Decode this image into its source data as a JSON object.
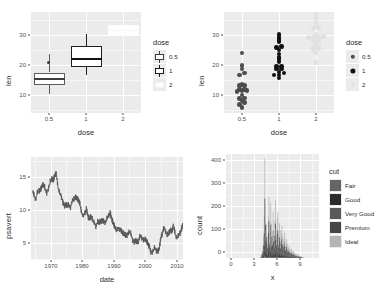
{
  "figure": {
    "layout": "2x2 grid of ggplot2 plots",
    "background": "#ffffff",
    "panel_bg": "#ebebeb",
    "gridline_color": "#ffffff",
    "text_color": "#2b2b2b"
  },
  "chart_data": [
    {
      "id": "boxplot-tooth-growth",
      "type": "boxplot",
      "title": "",
      "xlabel": "dose",
      "ylabel": "len",
      "categories": [
        "0.5",
        "1",
        "2"
      ],
      "xtick_labels": [
        "0.5",
        "1",
        "2"
      ],
      "ytick_labels": [
        "10",
        "20",
        "30"
      ],
      "yticks": [
        10,
        20,
        30
      ],
      "ylim": [
        2.5,
        34.5
      ],
      "grid": true,
      "legend": {
        "title": "dose",
        "position": "right",
        "entries": [
          {
            "label": "0.5",
            "fill": "#ffffff",
            "stroke": "#3d3d3d"
          },
          {
            "label": "1",
            "fill": "#ffffff",
            "stroke": "#1a1a1a"
          },
          {
            "label": "2",
            "fill": "#ffffff",
            "stroke": "#f2f2f2"
          }
        ]
      },
      "boxes": [
        {
          "category": "0.5",
          "lower_whisker": 4.2,
          "q1": 7.3,
          "median": 9.85,
          "q3": 11.3,
          "upper_whisker": 17.3,
          "outliers": [
            21.5
          ],
          "fill": "#ffffff",
          "stroke": "#5c5c5c"
        },
        {
          "category": "1",
          "lower_whisker": 13.6,
          "q1": 16.25,
          "median": 19.25,
          "q3": 23.4,
          "upper_whisker": 27.3,
          "outliers": [],
          "fill": "#ffffff",
          "stroke": "#1a1a1a"
        },
        {
          "category": "2",
          "lower_whisker": 22.4,
          "q1": 23.5,
          "median": 25.95,
          "q3": 27.3,
          "upper_whisker": 33.9,
          "outliers": [],
          "fill": "#ffffff",
          "stroke": "#fbfbfb"
        }
      ]
    },
    {
      "id": "dotplot-tooth-growth",
      "type": "dotplot",
      "title": "",
      "xlabel": "dose",
      "ylabel": "len",
      "categories": [
        "0.5",
        "1",
        "2"
      ],
      "xtick_labels": [
        "0.5",
        "1",
        "2"
      ],
      "ytick_labels": [
        "10",
        "20",
        "30"
      ],
      "yticks": [
        10,
        20,
        30
      ],
      "ylim": [
        2.5,
        34.5
      ],
      "grid": true,
      "legend": {
        "title": "dose",
        "position": "right",
        "entries": [
          {
            "label": "0.5",
            "color": "#4d4d4d"
          },
          {
            "label": "1",
            "color": "#111111"
          },
          {
            "label": "2",
            "color": "#e0e0e0"
          }
        ]
      },
      "series": [
        {
          "name": "0.5",
          "color": "#4d4d4d",
          "values": [
            4.2,
            11.5,
            7.3,
            5.8,
            6.4,
            10.0,
            11.2,
            11.2,
            5.2,
            7.0,
            15.2,
            21.5,
            17.6,
            9.7,
            14.5,
            10.0,
            8.2,
            9.4,
            16.5,
            9.7
          ]
        },
        {
          "name": "1",
          "color": "#111111",
          "values": [
            16.5,
            16.5,
            15.2,
            17.3,
            22.5,
            17.3,
            13.6,
            14.5,
            18.8,
            15.5,
            19.7,
            23.3,
            23.6,
            26.4,
            20.0,
            25.2,
            25.8,
            21.2,
            14.5,
            27.3
          ]
        },
        {
          "name": "2",
          "color": "#e0e0e0",
          "values": [
            23.6,
            18.5,
            33.9,
            25.5,
            26.4,
            32.5,
            26.7,
            21.5,
            23.3,
            29.5,
            25.5,
            26.4,
            22.4,
            24.5,
            24.8,
            30.9,
            26.4,
            27.3,
            29.4,
            23.0
          ]
        }
      ]
    },
    {
      "id": "line-economics-psavert",
      "type": "line",
      "title": "",
      "xlabel": "date",
      "ylabel": "psavert",
      "xtick_labels": [
        "1970",
        "1980",
        "1990",
        "2000",
        "2010"
      ],
      "xticks": [
        1970,
        1980,
        1990,
        2000,
        2010
      ],
      "ytick_labels": [
        "5",
        "10",
        "15"
      ],
      "yticks": [
        5,
        10,
        15
      ],
      "xlim": [
        1967,
        2015
      ],
      "ylim": [
        1.9,
        17.6
      ],
      "line_color": "#595959",
      "grid": true,
      "x": [
        1967.5,
        1968.0,
        1968.5,
        1969.0,
        1969.5,
        1970.0,
        1970.5,
        1971.0,
        1971.5,
        1972.0,
        1972.5,
        1973.0,
        1973.5,
        1974.0,
        1974.5,
        1975.0,
        1975.5,
        1976.0,
        1976.5,
        1977.0,
        1977.5,
        1978.0,
        1978.5,
        1979.0,
        1979.5,
        1980.0,
        1980.5,
        1981.0,
        1981.5,
        1982.0,
        1982.5,
        1983.0,
        1983.5,
        1984.0,
        1984.5,
        1985.0,
        1985.5,
        1986.0,
        1986.5,
        1987.0,
        1987.5,
        1988.0,
        1988.5,
        1989.0,
        1989.5,
        1990.0,
        1990.5,
        1991.0,
        1991.5,
        1992.0,
        1992.5,
        1993.0,
        1993.5,
        1994.0,
        1994.5,
        1995.0,
        1995.5,
        1996.0,
        1996.5,
        1997.0,
        1997.5,
        1998.0,
        1998.5,
        1999.0,
        1999.5,
        2000.0,
        2000.5,
        2001.0,
        2001.5,
        2002.0,
        2002.5,
        2003.0,
        2003.5,
        2004.0,
        2004.5,
        2005.0,
        2005.5,
        2006.0,
        2006.5,
        2007.0,
        2007.5,
        2008.0,
        2008.5,
        2009.0,
        2009.5,
        2010.0,
        2010.5,
        2011.0,
        2011.5,
        2012.0,
        2012.5,
        2013.0,
        2013.5,
        2014.0,
        2014.5,
        2015.0
      ],
      "y": [
        12.5,
        11.7,
        11.0,
        12.2,
        12.4,
        12.6,
        13.2,
        13.4,
        12.8,
        12.0,
        12.8,
        13.8,
        14.3,
        14.0,
        14.8,
        15.1,
        13.0,
        12.2,
        11.6,
        10.8,
        10.1,
        10.4,
        10.2,
        10.4,
        9.8,
        11.0,
        11.2,
        11.5,
        11.3,
        11.0,
        10.4,
        9.0,
        8.6,
        9.0,
        9.7,
        8.5,
        8.2,
        8.6,
        8.0,
        7.6,
        7.0,
        7.8,
        7.6,
        7.8,
        7.9,
        7.8,
        7.5,
        8.3,
        8.6,
        9.1,
        8.1,
        7.5,
        6.9,
        6.5,
        6.7,
        6.6,
        6.4,
        6.0,
        5.9,
        5.6,
        5.7,
        6.2,
        6.0,
        5.0,
        4.6,
        4.9,
        4.6,
        4.8,
        5.8,
        5.2,
        5.0,
        5.1,
        4.8,
        4.3,
        3.8,
        2.8,
        3.2,
        3.8,
        3.3,
        3.2,
        3.6,
        5.3,
        6.0,
        7.0,
        6.2,
        5.8,
        6.0,
        6.5,
        6.2,
        7.2,
        5.9,
        5.2,
        5.6,
        5.9,
        6.5,
        7.5
      ]
    },
    {
      "id": "histogram-diamonds-x",
      "type": "histogram",
      "title": "",
      "xlabel": "x",
      "ylabel": "count",
      "xtick_labels": [
        "0",
        "3",
        "6",
        "9"
      ],
      "xticks": [
        0,
        3,
        6,
        9
      ],
      "ytick_labels": [
        "0",
        "100",
        "200",
        "300",
        "400"
      ],
      "yticks": [
        0,
        100,
        200,
        300,
        400
      ],
      "xlim": [
        -0.6,
        11.2
      ],
      "ylim": [
        0,
        450
      ],
      "grid": true,
      "legend": {
        "title": "cut",
        "position": "right",
        "entries": [
          {
            "label": "Fair",
            "fill": "#656565"
          },
          {
            "label": "Good",
            "fill": "#2b2b2b"
          },
          {
            "label": "Very Good",
            "fill": "#585858"
          },
          {
            "label": "Premium",
            "fill": "#474747"
          },
          {
            "label": "Ideal",
            "fill": "#b5b5b5"
          }
        ]
      },
      "bins_x": [
        3.75,
        3.83,
        3.9,
        3.98,
        4.05,
        4.13,
        4.2,
        4.28,
        4.35,
        4.43,
        4.5,
        4.58,
        4.65,
        4.73,
        4.8,
        4.88,
        4.95,
        5.03,
        5.1,
        5.18,
        5.25,
        5.33,
        5.4,
        5.48,
        5.55,
        5.63,
        5.7,
        5.78,
        5.85,
        5.93,
        6.0,
        6.08,
        6.15,
        6.23,
        6.3,
        6.38,
        6.45,
        6.53,
        6.6,
        6.68,
        6.75,
        6.83,
        6.9,
        6.98,
        7.05,
        7.13,
        7.2,
        7.28,
        7.35,
        7.43,
        7.5,
        7.58,
        7.65,
        7.73,
        7.8,
        7.88,
        7.95,
        8.03,
        8.1,
        8.18,
        8.25,
        8.33,
        8.4,
        8.48,
        8.55,
        8.63,
        8.7,
        8.78,
        8.85,
        8.93,
        9.0,
        9.08,
        9.15
      ],
      "bins_count": [
        4,
        10,
        22,
        30,
        48,
        95,
        180,
        430,
        240,
        120,
        150,
        95,
        70,
        180,
        265,
        100,
        75,
        240,
        150,
        85,
        95,
        200,
        120,
        75,
        160,
        250,
        130,
        90,
        175,
        200,
        95,
        70,
        150,
        120,
        70,
        105,
        140,
        95,
        60,
        80,
        110,
        85,
        50,
        60,
        80,
        60,
        40,
        45,
        55,
        40,
        30,
        35,
        40,
        28,
        22,
        26,
        30,
        20,
        16,
        18,
        20,
        14,
        10,
        12,
        14,
        9,
        7,
        8,
        9,
        6,
        4,
        3,
        2
      ]
    }
  ]
}
